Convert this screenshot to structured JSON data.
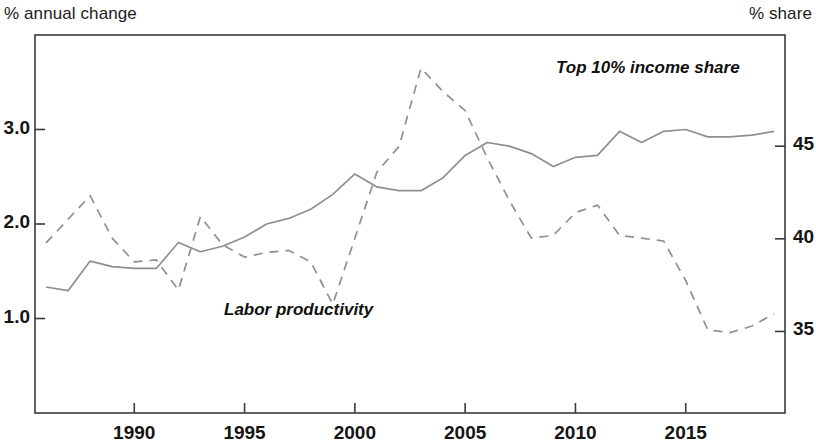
{
  "axis_titles": {
    "left": "% annual change",
    "right": "% share"
  },
  "annotations": {
    "top_income": "Top 10% income share",
    "labor_productivity": "Labor productivity"
  },
  "colors": {
    "line": "#8f8f8f",
    "axis": "#3a3a3a",
    "text": "#141414",
    "background": "#ffffff"
  },
  "chart_data": {
    "type": "line",
    "title": "",
    "subtitle": "",
    "xlabel": "",
    "ylabel": "% annual change",
    "ylabel_right": "% share",
    "grid": false,
    "legend": "inline-annotations",
    "xlim": [
      1985.5,
      2019.5
    ],
    "xticks": [
      1990,
      1995,
      2000,
      2005,
      2010,
      2015
    ],
    "xtick_labels": [
      "1990",
      "1995",
      "2000",
      "2005",
      "2010",
      "2015"
    ],
    "ylim_left": [
      0.0,
      4.0
    ],
    "yticks_left": [
      1.0,
      2.0,
      3.0
    ],
    "ytick_labels_left": [
      "1.0",
      "2.0",
      "3.0"
    ],
    "ylim_right": [
      30.6,
      51.0
    ],
    "yticks_right": [
      35,
      40,
      45
    ],
    "ytick_labels_right": [
      "35",
      "40",
      "45"
    ],
    "x": [
      1986,
      1987,
      1988,
      1989,
      1990,
      1991,
      1992,
      1993,
      1994,
      1995,
      1996,
      1997,
      1998,
      1999,
      2000,
      2001,
      2002,
      2003,
      2004,
      2005,
      2006,
      2007,
      2008,
      2009,
      2010,
      2011,
      2012,
      2013,
      2014,
      2015,
      2016,
      2017,
      2018,
      2019
    ],
    "series": [
      {
        "name": "Top 10% income share",
        "axis": "right",
        "style": "solid",
        "units": "% share",
        "values": [
          37.4,
          37.2,
          38.8,
          38.5,
          38.4,
          38.4,
          39.8,
          39.3,
          39.6,
          40.1,
          40.8,
          41.1,
          41.6,
          42.4,
          43.5,
          42.8,
          42.6,
          42.6,
          43.3,
          44.5,
          45.2,
          45.0,
          44.6,
          43.9,
          44.4,
          44.5,
          45.8,
          45.2,
          45.8,
          45.9,
          45.5,
          45.5,
          45.6,
          45.8
        ]
      },
      {
        "name": "Labor productivity",
        "axis": "left",
        "style": "dashed",
        "units": "% annual change",
        "values": [
          1.8,
          2.05,
          2.3,
          1.85,
          1.6,
          1.62,
          1.3,
          2.08,
          1.78,
          1.65,
          1.7,
          1.72,
          1.6,
          1.15,
          1.85,
          2.55,
          2.82,
          3.65,
          3.4,
          3.2,
          2.7,
          2.25,
          1.85,
          1.88,
          2.12,
          2.2,
          1.88,
          1.85,
          1.82,
          1.4,
          0.88,
          0.85,
          0.92,
          1.05
        ]
      }
    ]
  }
}
